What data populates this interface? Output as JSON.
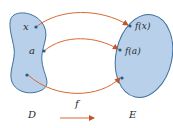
{
  "diagram": {
    "type": "function-mapping",
    "colors": {
      "set_fill": "#b9d0ea",
      "set_stroke": "#3f6d9e",
      "arrow": "#d9682e",
      "point": "#1f5f8a",
      "text": "#2a2a2a"
    },
    "domain_set": {
      "label": "D",
      "points": [
        {
          "label": "x"
        },
        {
          "label": "a"
        },
        {
          "label": ""
        }
      ]
    },
    "codomain_set": {
      "label": "E",
      "points": [
        {
          "label": "f(x)"
        },
        {
          "label": "f(a)"
        },
        {
          "label": ""
        }
      ]
    },
    "function_label": "f"
  }
}
